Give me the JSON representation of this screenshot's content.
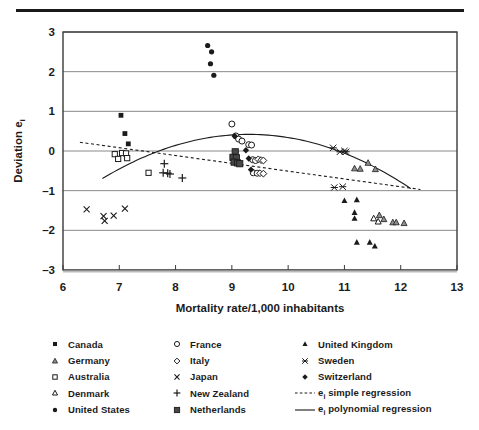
{
  "figure": {
    "top_rule": true,
    "axis_color": "#3a3a3a",
    "ink_color": "#1b1b1b"
  },
  "chart_data": {
    "type": "scatter",
    "title": "",
    "xlabel": "Mortality rate/1,000 inhabitants",
    "ylabel": "Deviation eᵢ",
    "ylabel_text": "Deviation e",
    "ylabel_sub": "i",
    "xlim": [
      6,
      13
    ],
    "ylim": [
      -3,
      3
    ],
    "xticks": [
      6,
      7,
      8,
      9,
      10,
      11,
      12,
      13
    ],
    "yticks": [
      3,
      2,
      1,
      0,
      -1,
      -2,
      -3
    ],
    "xtick_labels": [
      "6",
      "7",
      "8",
      "9",
      "10",
      "11",
      "12",
      "13"
    ],
    "ytick_labels": [
      "3",
      "2",
      "1",
      "0",
      "–1",
      "–2",
      "–3"
    ],
    "grid": "horizontal",
    "legend_position": "below-plot",
    "series": [
      {
        "name": "Canada",
        "marker": "filled-square",
        "points": [
          [
            7.03,
            0.9
          ],
          [
            7.1,
            0.44
          ],
          [
            7.16,
            0.18
          ]
        ]
      },
      {
        "name": "Germany",
        "marker": "gray-triangle",
        "points": [
          [
            11.42,
            -0.3
          ],
          [
            11.18,
            -0.44
          ],
          [
            11.28,
            -0.45
          ],
          [
            11.55,
            -0.46
          ],
          [
            11.62,
            -1.62
          ],
          [
            11.7,
            -1.72
          ],
          [
            11.86,
            -1.8
          ],
          [
            11.92,
            -1.8
          ],
          [
            12.06,
            -1.82
          ]
        ]
      },
      {
        "name": "Australia",
        "marker": "open-square",
        "points": [
          [
            6.92,
            -0.08
          ],
          [
            6.98,
            -0.2
          ],
          [
            7.05,
            -0.05
          ],
          [
            7.12,
            -0.06
          ],
          [
            7.14,
            -0.18
          ],
          [
            7.52,
            -0.55
          ]
        ]
      },
      {
        "name": "Denmark",
        "marker": "open-triangle",
        "points": [
          [
            11.52,
            -1.7
          ],
          [
            11.6,
            -1.78
          ]
        ]
      },
      {
        "name": "United States",
        "marker": "filled-circle",
        "points": [
          [
            8.57,
            2.66
          ],
          [
            8.64,
            2.5
          ],
          [
            8.62,
            2.2
          ],
          [
            8.68,
            1.91
          ]
        ]
      },
      {
        "name": "France",
        "marker": "open-circle",
        "points": [
          [
            9.0,
            0.68
          ],
          [
            9.07,
            0.38
          ],
          [
            9.12,
            0.3
          ],
          [
            9.18,
            0.25
          ],
          [
            9.3,
            0.16
          ],
          [
            9.35,
            0.15
          ],
          [
            9.37,
            -0.22
          ],
          [
            9.42,
            -0.24
          ],
          [
            9.38,
            -0.55
          ],
          [
            9.45,
            -0.56
          ]
        ]
      },
      {
        "name": "Italy",
        "marker": "open-diamond",
        "points": [
          [
            9.47,
            -0.21
          ],
          [
            9.52,
            -0.23
          ],
          [
            9.56,
            -0.24
          ],
          [
            9.5,
            -0.56
          ],
          [
            9.56,
            -0.57
          ]
        ]
      },
      {
        "name": "Japan",
        "marker": "cross-x",
        "points": [
          [
            6.42,
            -1.47
          ],
          [
            6.72,
            -1.64
          ],
          [
            6.74,
            -1.76
          ],
          [
            6.9,
            -1.63
          ],
          [
            7.1,
            -1.45
          ]
        ]
      },
      {
        "name": "New Zealand",
        "marker": "plus",
        "points": [
          [
            7.8,
            -0.32
          ],
          [
            7.78,
            -0.55
          ],
          [
            7.86,
            -0.56
          ],
          [
            7.9,
            -0.58
          ],
          [
            8.12,
            -0.68
          ]
        ]
      },
      {
        "name": "Netherlands",
        "marker": "filled-square-lg",
        "points": [
          [
            9.06,
            -0.02
          ],
          [
            9.02,
            -0.16
          ],
          [
            9.08,
            -0.17
          ],
          [
            9.04,
            -0.28
          ],
          [
            9.1,
            -0.3
          ],
          [
            9.14,
            -0.32
          ]
        ]
      },
      {
        "name": "United Kingdom",
        "marker": "filled-triangle",
        "points": [
          [
            11.0,
            -1.25
          ],
          [
            11.22,
            -1.23
          ],
          [
            11.18,
            -1.7
          ],
          [
            11.18,
            -1.55
          ],
          [
            11.45,
            -2.3
          ],
          [
            11.54,
            -2.4
          ],
          [
            11.22,
            -2.3
          ]
        ]
      },
      {
        "name": "Sweden",
        "marker": "asterisk",
        "points": [
          [
            10.8,
            0.08
          ],
          [
            11.0,
            0.0
          ],
          [
            10.92,
            -0.02
          ],
          [
            11.03,
            -0.02
          ],
          [
            10.82,
            -0.92
          ],
          [
            10.97,
            -0.9
          ]
        ]
      },
      {
        "name": "Switzerland",
        "marker": "filled-diamond",
        "points": [
          [
            9.05,
            0.38
          ],
          [
            9.25,
            0.02
          ],
          [
            9.3,
            -0.19
          ],
          [
            9.34,
            -0.47
          ]
        ]
      }
    ],
    "fits": [
      {
        "name": "eᵢ simple regression",
        "style": "dotted",
        "kind": "linear",
        "x_from": 6.3,
        "x_to": 12.35,
        "y_from": 0.22,
        "y_to": -0.97
      },
      {
        "name": "eᵢ polynomial regression",
        "style": "solid",
        "kind": "quadratic",
        "x_from": 6.7,
        "x_to": 12.18,
        "vertex_x": 9.3,
        "vertex_y": 0.42,
        "a": -0.165
      }
    ]
  },
  "legend": {
    "columns": [
      {
        "items": [
          {
            "marker": "filled-square",
            "label": "Canada"
          },
          {
            "marker": "gray-triangle",
            "label": "Germany"
          },
          {
            "marker": "open-square",
            "label": "Australia"
          },
          {
            "marker": "open-triangle",
            "label": "Denmark"
          },
          {
            "marker": "filled-circle",
            "label": "United States"
          }
        ]
      },
      {
        "items": [
          {
            "marker": "open-circle",
            "label": "France"
          },
          {
            "marker": "open-diamond",
            "label": "Italy"
          },
          {
            "marker": "cross-x",
            "label": "Japan"
          },
          {
            "marker": "plus",
            "label": "New Zealand"
          },
          {
            "marker": "filled-square-lg",
            "label": "Netherlands"
          }
        ]
      },
      {
        "items": [
          {
            "marker": "filled-triangle",
            "label": "United Kingdom"
          },
          {
            "marker": "asterisk",
            "label": "Sweden"
          },
          {
            "marker": "filled-diamond",
            "label": "Switzerland"
          },
          {
            "marker": "dotted-line",
            "label": "e",
            "sub": "i",
            "label_rest": " simple regression"
          },
          {
            "marker": "solid-line",
            "label": "e",
            "sub": "i",
            "label_rest": " polynomial regression"
          }
        ]
      }
    ]
  }
}
